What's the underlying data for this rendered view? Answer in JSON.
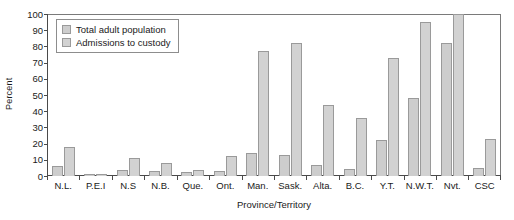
{
  "chart_data": {
    "type": "bar",
    "title": "",
    "xlabel": "Province/Territory",
    "ylabel": "Percent",
    "ylim": [
      0,
      100
    ],
    "yticks": [
      0,
      10,
      20,
      30,
      40,
      50,
      60,
      70,
      80,
      90,
      100
    ],
    "grid": false,
    "legend_position": "top-left",
    "categories": [
      "N.L.",
      "P.E.I",
      "N.S",
      "N.B.",
      "Que.",
      "Ont.",
      "Man.",
      "Sask.",
      "Alta.",
      "B.C.",
      "Y.T.",
      "N.W.T.",
      "Nvt.",
      "CSC"
    ],
    "series": [
      {
        "name": "Total adult population",
        "color": "#cdcdcd",
        "values": [
          6,
          1,
          3.5,
          3,
          2.5,
          3,
          14,
          13,
          7,
          4.5,
          22,
          48,
          82,
          5
        ]
      },
      {
        "name": "Admissions to custody",
        "color": "#d2d2d2",
        "values": [
          18,
          1.5,
          11,
          8,
          4,
          12.5,
          77,
          82,
          44,
          36,
          73,
          95,
          100,
          23
        ]
      }
    ]
  },
  "axis": {
    "y_title": "Percent",
    "x_title": "Province/Territory"
  }
}
